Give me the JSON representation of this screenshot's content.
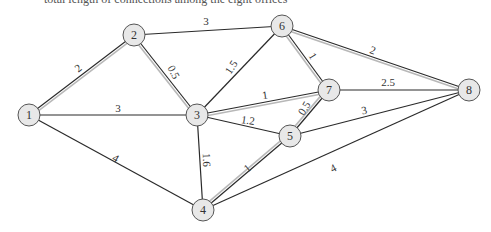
{
  "caption": "total length of connections among the eight offices",
  "colors": {
    "edge": "#2a2a2a",
    "highlight": "#b8b8b8",
    "node_fill": "#e8e8e8",
    "node_stroke": "#555555"
  },
  "nodes": [
    {
      "id": "1",
      "x": 29,
      "y": 115
    },
    {
      "id": "2",
      "x": 134,
      "y": 35
    },
    {
      "id": "3",
      "x": 197,
      "y": 115
    },
    {
      "id": "4",
      "x": 203,
      "y": 210
    },
    {
      "id": "5",
      "x": 290,
      "y": 136
    },
    {
      "id": "6",
      "x": 282,
      "y": 26
    },
    {
      "id": "7",
      "x": 329,
      "y": 90
    },
    {
      "id": "8",
      "x": 469,
      "y": 90
    }
  ],
  "edges": [
    {
      "from": "1",
      "to": "2",
      "weight": "2",
      "highlighted": true,
      "lx": 78,
      "ly": 68,
      "rot": -38
    },
    {
      "from": "1",
      "to": "3",
      "weight": "3",
      "highlighted": false,
      "lx": 118,
      "ly": 108,
      "rot": 0
    },
    {
      "from": "1",
      "to": "4",
      "weight": "4",
      "highlighted": false,
      "lx": 116,
      "ly": 158,
      "rot": 30
    },
    {
      "from": "2",
      "to": "6",
      "weight": "3",
      "highlighted": false,
      "lx": 206,
      "ly": 21,
      "rot": 0
    },
    {
      "from": "2",
      "to": "3",
      "weight": "0.5",
      "highlighted": true,
      "lx": 174,
      "ly": 72,
      "rot": 62
    },
    {
      "from": "3",
      "to": "6",
      "weight": "1.5",
      "highlighted": false,
      "lx": 231,
      "ly": 67,
      "rot": -56
    },
    {
      "from": "3",
      "to": "7",
      "weight": "1",
      "highlighted": true,
      "lx": 265,
      "ly": 95,
      "rot": -8
    },
    {
      "from": "3",
      "to": "5",
      "weight": "1.2",
      "highlighted": false,
      "lx": 248,
      "ly": 120,
      "rot": 8
    },
    {
      "from": "3",
      "to": "4",
      "weight": "1.6",
      "highlighted": false,
      "lx": 207,
      "ly": 160,
      "rot": 88
    },
    {
      "from": "6",
      "to": "7",
      "weight": "1",
      "highlighted": true,
      "lx": 313,
      "ly": 56,
      "rot": 58
    },
    {
      "from": "6",
      "to": "8",
      "weight": "2",
      "highlighted": true,
      "lx": 373,
      "ly": 50,
      "rot": 20
    },
    {
      "from": "7",
      "to": "8",
      "weight": "2.5",
      "highlighted": false,
      "lx": 388,
      "ly": 82,
      "rot": 0
    },
    {
      "from": "7",
      "to": "5",
      "weight": "0.5",
      "highlighted": true,
      "lx": 304,
      "ly": 108,
      "rot": -58
    },
    {
      "from": "5",
      "to": "8",
      "weight": "3",
      "highlighted": false,
      "lx": 364,
      "ly": 110,
      "rot": -12
    },
    {
      "from": "5",
      "to": "4",
      "weight": "1",
      "highlighted": true,
      "lx": 247,
      "ly": 168,
      "rot": -40
    },
    {
      "from": "4",
      "to": "8",
      "weight": "4",
      "highlighted": false,
      "lx": 333,
      "ly": 168,
      "rot": -28
    }
  ]
}
